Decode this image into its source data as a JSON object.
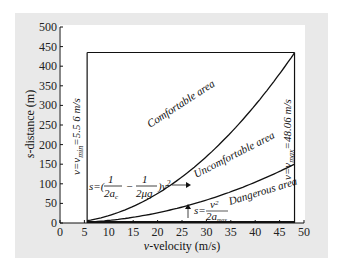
{
  "chart_data": {
    "type": "line",
    "title": "",
    "xlabel": "v-velocity (m/s)",
    "ylabel": "s-distance (m)",
    "xlim": [
      0,
      50
    ],
    "ylim": [
      0,
      500
    ],
    "x_ticks": [
      0,
      5,
      10,
      15,
      20,
      25,
      30,
      35,
      40,
      45,
      50
    ],
    "y_ticks": [
      0,
      50,
      100,
      150,
      200,
      250,
      300,
      350,
      400,
      450,
      500
    ],
    "grid": false,
    "boundaries": {
      "v_min": 5.56,
      "v_max": 48.06,
      "s_top": 435,
      "v_min_label": "v=v_min=5.5 6 m/s",
      "v_max_label": "v=v_max=48.06 m/s"
    },
    "series": [
      {
        "name": "s=(1/(2a_c) - 1/(2μg))v²",
        "formula_coefficient": 0.188,
        "x": [
          5.56,
          10,
          15,
          20,
          25,
          30,
          35,
          40,
          45,
          48.06
        ],
        "values": [
          5.8,
          18.8,
          42.3,
          75.2,
          117.5,
          169.2,
          230.3,
          300.8,
          380.7,
          435
        ]
      },
      {
        "name": "s=v²/(2a_max)",
        "formula_coefficient": 0.065,
        "x": [
          5.56,
          10,
          15,
          20,
          25,
          30,
          35,
          40,
          45,
          48.06
        ],
        "values": [
          2.0,
          6.5,
          14.6,
          26.0,
          40.6,
          58.5,
          79.6,
          104.0,
          131.6,
          150
        ]
      }
    ],
    "regions": [
      {
        "label": "Comfortable area"
      },
      {
        "label": "Uncomfortable area"
      },
      {
        "label": "Dangerous area"
      }
    ],
    "annotations": [
      {
        "text": "s=(1/2a_c − 1/2μg)v²",
        "points_to": "upper curve"
      },
      {
        "text": "s=v²/2a_max",
        "points_to": "lower curve"
      }
    ]
  },
  "labels": {
    "xlabel": "v-velocity (m/s)",
    "ylabel": "s-distance (m)",
    "comfortable": "Comfortable area",
    "uncomfortable": "Uncomfortable area",
    "dangerous": "Dangerous area"
  }
}
